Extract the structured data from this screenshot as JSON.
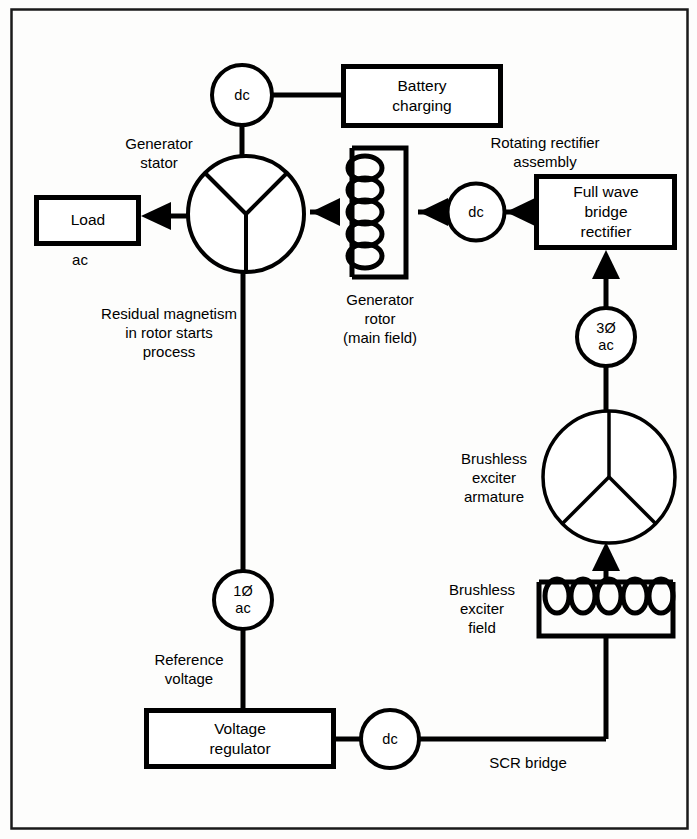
{
  "diagram": {
    "border_color": "#1a1a1a",
    "line_color": "#000000",
    "background": "#fdfdfc"
  },
  "boxes": {
    "battery_charging": "Battery\ncharging",
    "load": "Load",
    "full_wave_bridge_rectifier": "Full wave\nbridge\nrectifier",
    "voltage_regulator": "Voltage\nregulator"
  },
  "nodes": {
    "dc_battery": "dc",
    "dc_rotating_rectifier": "dc",
    "dc_scr": "dc",
    "three_phase_ac": "3Ø\nac",
    "single_phase_ac": "1Ø\nac"
  },
  "labels": {
    "generator_stator": "Generator\nstator",
    "rotating_rectifier_assembly": "Rotating rectifier\nassembly",
    "generator_rotor": "Generator\nrotor\n(main field)",
    "load_ac": "ac",
    "residual_magnetism": "Residual magnetism\nin rotor starts\nprocess",
    "brushless_exciter_armature": "Brushless\nexciter\narmature",
    "brushless_exciter_field": "Brushless\nexciter\nfield",
    "reference_voltage": "Reference\nvoltage",
    "scr_bridge": "SCR bridge"
  }
}
